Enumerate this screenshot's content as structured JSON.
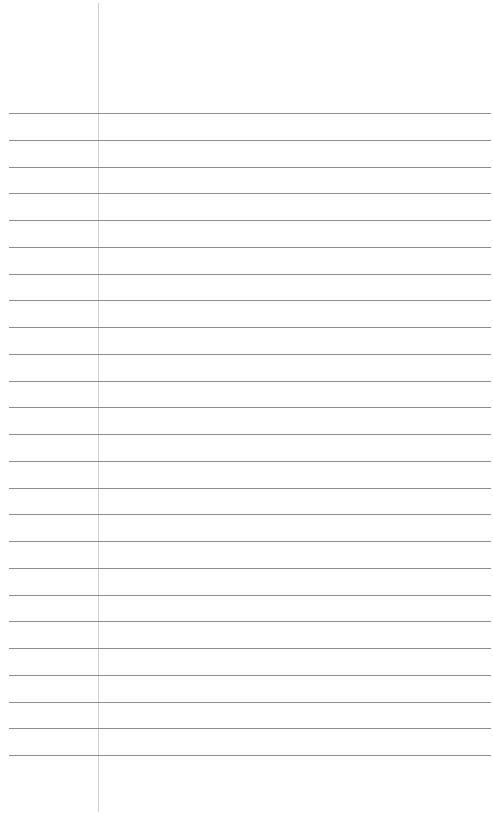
{
  "page": {
    "type": "blank lined paper",
    "width": 493,
    "height": 815,
    "background_color": "#ffffff"
  },
  "margin_line": {
    "x": 98,
    "top": 3,
    "bottom": 812,
    "color": "#cfcfcf"
  },
  "rules": {
    "count": 25,
    "first_y": 113,
    "last_y": 755,
    "left": 9,
    "right": 491,
    "color": "#8e8e8e"
  },
  "text_content": []
}
